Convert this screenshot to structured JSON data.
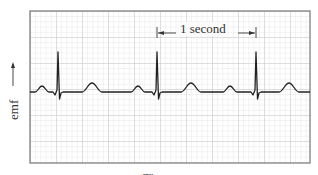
{
  "figure": {
    "y_axis_label": "emf",
    "x_axis_label": "Time",
    "interval_annotation": "1 second",
    "colors": {
      "grid_minor": "#dcdcdc",
      "grid_major": "#c4c4c4",
      "frame": "#777777",
      "trace": "#222222",
      "background": "#ffffff"
    },
    "trace": {
      "type": "ECG",
      "beats": 3,
      "qrs_x": [
        58,
        157,
        256
      ],
      "baseline_y": 92,
      "r_peak_y": 52,
      "s_trough_y": 99,
      "beat_period_px": 99
    }
  }
}
